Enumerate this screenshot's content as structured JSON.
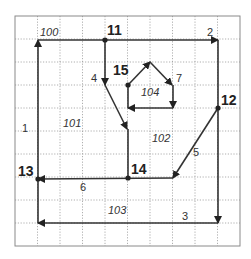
{
  "diagram": {
    "type": "directed-graph-on-grid",
    "grid": {
      "x_lines": [
        15,
        37.5,
        60,
        82.5,
        105,
        127.5,
        150,
        172.5,
        195,
        217.5,
        240
      ],
      "y_lines": [
        16,
        39,
        62,
        85,
        108,
        131,
        154,
        177,
        200,
        223,
        246
      ],
      "border_color": "#8a8a8a",
      "line_color": "#9a9a9a"
    },
    "nodes": [
      {
        "id": "11",
        "label": "11",
        "x": 105,
        "y": 40,
        "label_x": 107,
        "label_y": 35
      },
      {
        "id": "12",
        "label": "12",
        "x": 218,
        "y": 108,
        "label_x": 221,
        "label_y": 105
      },
      {
        "id": "13",
        "label": "13",
        "x": 38,
        "y": 179,
        "label_x": 18,
        "label_y": 176
      },
      {
        "id": "14",
        "label": "14",
        "x": 128,
        "y": 178,
        "label_x": 131,
        "label_y": 174
      },
      {
        "id": "15",
        "label": "15",
        "x": 128,
        "y": 85,
        "label_x": 113,
        "label_y": 75
      }
    ],
    "edges": [
      {
        "id": "1",
        "label": "1",
        "points": [
          [
            38,
            223
          ],
          [
            38,
            40
          ]
        ],
        "arrow_at": [
          38,
          40
        ],
        "arrow_dir": "up",
        "label_x": 22,
        "label_y": 132
      },
      {
        "id": "2",
        "label": "2",
        "points": [
          [
            38,
            40
          ],
          [
            218,
            40
          ]
        ],
        "arrow_at": [
          218,
          40
        ],
        "arrow_dir": "right",
        "label_x": 207,
        "label_y": 36
      },
      {
        "id": "2b",
        "label": "",
        "points": [
          [
            218,
            40
          ],
          [
            218,
            223
          ]
        ],
        "arrow_at": [
          218,
          223
        ],
        "arrow_dir": "down"
      },
      {
        "id": "3",
        "label": "3",
        "points": [
          [
            218,
            223
          ],
          [
            38,
            223
          ]
        ],
        "arrow_at": [
          38,
          223
        ],
        "arrow_dir": "left",
        "label_x": 182,
        "label_y": 220
      },
      {
        "id": "4",
        "label": "4",
        "points": [
          [
            105,
            40
          ],
          [
            105,
            85
          ]
        ],
        "arrow_at": [
          105,
          85
        ],
        "arrow_dir": "down",
        "label_x": 91,
        "label_y": 82
      },
      {
        "id": "4b",
        "label": "",
        "points": [
          [
            105,
            85
          ],
          [
            127,
            129
          ]
        ],
        "arrow_at": [
          127,
          129
        ],
        "arrow_dir": "diag-down"
      },
      {
        "id": "4c",
        "label": "",
        "points": [
          [
            128,
            129
          ],
          [
            128,
            178
          ]
        ],
        "arrow_at": null,
        "arrow_dir": null
      },
      {
        "id": "5",
        "label": "5",
        "points": [
          [
            218,
            108
          ],
          [
            173,
            178
          ]
        ],
        "arrow_at": [
          173,
          178
        ],
        "arrow_dir": "diag-down-left",
        "label_x": 193,
        "label_y": 156
      },
      {
        "id": "6",
        "label": "6",
        "points": [
          [
            173,
            178
          ],
          [
            38,
            179
          ]
        ],
        "arrow_at": [
          38,
          179
        ],
        "arrow_dir": "left",
        "label_x": 80,
        "label_y": 191
      },
      {
        "id": "7a",
        "label": "",
        "points": [
          [
            128,
            85
          ],
          [
            150,
            62
          ]
        ],
        "arrow_at": [
          150,
          62
        ],
        "arrow_dir": "diag-up-right"
      },
      {
        "id": "7",
        "label": "7",
        "points": [
          [
            150,
            62
          ],
          [
            172,
            85
          ]
        ],
        "arrow_at": [
          172,
          85
        ],
        "arrow_dir": "diag-down-right",
        "label_x": 176,
        "label_y": 82
      },
      {
        "id": "7b",
        "label": "",
        "points": [
          [
            173,
            85
          ],
          [
            173,
            108
          ]
        ],
        "arrow_at": [
          173,
          108
        ],
        "arrow_dir": "down"
      },
      {
        "id": "7c",
        "label": "",
        "points": [
          [
            173,
            108
          ],
          [
            128,
            108
          ]
        ],
        "arrow_at": [
          128,
          108
        ],
        "arrow_dir": "left"
      },
      {
        "id": "7d",
        "label": "",
        "points": [
          [
            128,
            108
          ],
          [
            128,
            85
          ]
        ],
        "arrow_at": null,
        "arrow_dir": null
      }
    ],
    "regions": [
      {
        "id": "100",
        "label": "100",
        "x": 40,
        "y": 36
      },
      {
        "id": "101",
        "label": "101",
        "x": 63,
        "y": 127
      },
      {
        "id": "102",
        "label": "102",
        "x": 152,
        "y": 142
      },
      {
        "id": "103",
        "label": "103",
        "x": 108,
        "y": 214
      },
      {
        "id": "104",
        "label": "104",
        "x": 141,
        "y": 96
      }
    ],
    "colors": {
      "edge": "#333333",
      "node": "#222222",
      "text": "#333333"
    }
  }
}
